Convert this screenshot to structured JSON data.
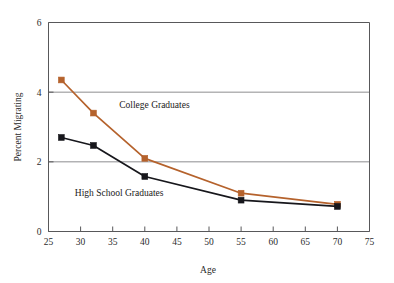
{
  "chart_data": {
    "type": "line",
    "title": "",
    "xlabel": "Age",
    "ylabel": "Percent Migrating",
    "xlim": [
      25,
      75
    ],
    "ylim": [
      0,
      6
    ],
    "xticks": [
      25,
      30,
      35,
      40,
      45,
      50,
      55,
      60,
      65,
      70,
      75
    ],
    "xtick_labels": [
      "25",
      "30",
      "35",
      "40",
      "45",
      "50",
      "55",
      "60",
      "65",
      "70",
      "75"
    ],
    "yticks": [
      0,
      2,
      4,
      6
    ],
    "ytick_labels": [
      "0",
      "2",
      "4",
      "6"
    ],
    "grid": "horizontal-at-major-y",
    "legend": "inline-annotations",
    "marker": "square",
    "series": [
      {
        "name": "College Graduates",
        "color": "#b5622c",
        "label_x": 41.5,
        "label_y": 3.55,
        "x": [
          27,
          32,
          40,
          55,
          70
        ],
        "values": [
          4.35,
          3.4,
          2.1,
          1.1,
          0.78
        ]
      },
      {
        "name": "High School Graduates",
        "color": "#17171c",
        "label_x": 36.0,
        "label_y": 1.03,
        "x": [
          27,
          32,
          40,
          55,
          70
        ],
        "values": [
          2.7,
          2.47,
          1.58,
          0.9,
          0.72
        ]
      }
    ]
  },
  "axes": {
    "x_axis_title": "Age",
    "y_axis_title": "Percent Migrating"
  },
  "colors": {
    "college": "#b5622c",
    "highschool": "#17171c",
    "grid": "#8d8d8f",
    "frame": "#58585a",
    "background": "#ffffff"
  }
}
